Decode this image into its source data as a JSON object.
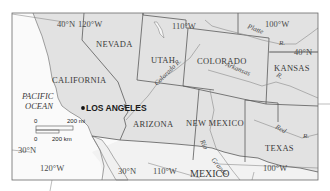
{
  "map": {
    "colors": {
      "land_us": "#e2e2e2",
      "land_mexico": "#f2f2f2",
      "ocean": "#fafafa",
      "border": "#5a5a5a",
      "river": "#8a8a8a",
      "frame": "#6a6a6a",
      "city_dot": "#111111"
    },
    "states": {
      "nevada": "NEVADA",
      "utah": "UTAH",
      "colorado": "COLORADO",
      "kansas": "KANSAS",
      "california": "CALIFORNIA",
      "arizona": "ARIZONA",
      "new_mexico": "NEW MEXICO",
      "texas": "TEXAS"
    },
    "country": {
      "mexico": "MEXICO"
    },
    "ocean": {
      "line1": "PACIFIC",
      "line2": "OCEAN"
    },
    "city": {
      "name": "LOS ANGELES"
    },
    "rivers": {
      "platte": "Platte",
      "platte_r": "R.",
      "colorado": "Colorado R.",
      "arkansas": "Arkansas",
      "kansas_r": "R.",
      "red": "Red",
      "red_r": "R.",
      "rio": "Rio",
      "grande": "Grande"
    },
    "grid_labels": {
      "lat40_left": "40°N",
      "lon120_top": "120°W",
      "lon110_top": "110°W",
      "lon100_top": "100°W",
      "lat40_right": "40°N",
      "lat30_left": "30°N",
      "lon120_bottom": "120°W",
      "lat30_bottom": "30°N",
      "lon110_bottom": "110°W",
      "lon100_bottom": "100°W"
    },
    "scale": {
      "top_zero": "0",
      "top_value": "200 mi",
      "bottom_zero": "0",
      "bottom_value": "200 km"
    }
  }
}
